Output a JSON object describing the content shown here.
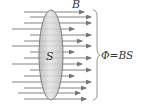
{
  "diagram": {
    "field_label": "B",
    "surface_label": "S",
    "formula": "Φ=BS",
    "colors": {
      "arrow": "#777777",
      "surface_fill": "#d6d6d6",
      "surface_stroke": "#666666",
      "brace": "#888888",
      "text": "#333333"
    },
    "field_lines": [
      {
        "y": 12,
        "x1": 24,
        "x2": 84
      },
      {
        "y": 17,
        "x1": 30,
        "x2": 91
      },
      {
        "y": 23,
        "x1": 24,
        "x2": 91
      },
      {
        "y": 29,
        "x1": 12,
        "x2": 74
      },
      {
        "y": 35,
        "x1": 30,
        "x2": 91
      },
      {
        "y": 41,
        "x1": 24,
        "x2": 82
      },
      {
        "y": 46,
        "x1": 12,
        "x2": 91
      },
      {
        "y": 52,
        "x1": 30,
        "x2": 74
      },
      {
        "y": 58,
        "x1": 24,
        "x2": 91
      },
      {
        "y": 64,
        "x1": 12,
        "x2": 82
      },
      {
        "y": 70,
        "x1": 30,
        "x2": 91
      },
      {
        "y": 76,
        "x1": 24,
        "x2": 74
      },
      {
        "y": 82,
        "x1": 12,
        "x2": 91
      },
      {
        "y": 88,
        "x1": 24,
        "x2": 86
      },
      {
        "y": 93,
        "x1": 18,
        "x2": 80
      },
      {
        "y": 99,
        "x1": 24,
        "x2": 86
      }
    ]
  }
}
